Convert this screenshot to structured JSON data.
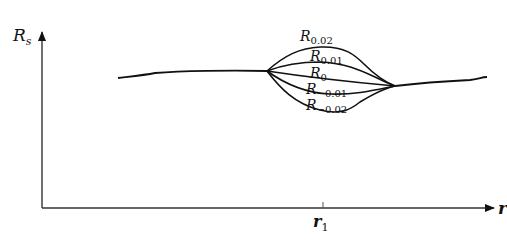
{
  "diagram": {
    "y_axis_label": "R",
    "y_axis_label_sub": "s",
    "x_axis_label": "r",
    "x_tick_label": "r",
    "x_tick_label_sub": "1",
    "curves": [
      {
        "name": "R",
        "sub": "0.02"
      },
      {
        "name": "R",
        "sub": "0.01"
      },
      {
        "name": "R",
        "sub": "0"
      },
      {
        "name": "R",
        "sub": "−0.01"
      },
      {
        "name": "R",
        "sub": "−0.02"
      }
    ],
    "colors": {
      "ink": "#111111",
      "background": "#ffffff"
    }
  }
}
